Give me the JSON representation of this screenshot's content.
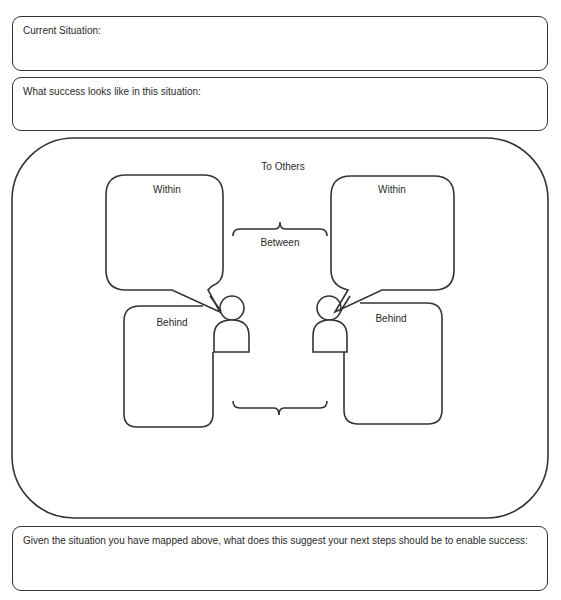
{
  "fields": {
    "current_situation": {
      "label": "Current Situation:",
      "value": ""
    },
    "success": {
      "label": "What success looks like in this situation:",
      "value": ""
    },
    "next_steps": {
      "label": "Given the situation you have mapped above, what does this suggest your next steps should be to enable success:",
      "value": ""
    }
  },
  "diagram": {
    "top_label": "To Others",
    "between_label": "Between",
    "left_person": {
      "within_label": "Within",
      "behind_label": "Behind"
    },
    "right_person": {
      "within_label": "Within",
      "behind_label": "Behind"
    }
  }
}
